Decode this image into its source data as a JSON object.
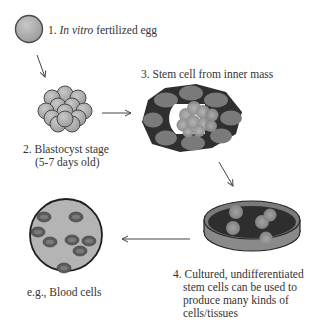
{
  "diagram": {
    "steps": [
      {
        "id": "egg",
        "number": "1.",
        "label_italic": "In vitro",
        "label_rest": " fertilized egg"
      },
      {
        "id": "blastocyst",
        "number": "2.",
        "line1": "Blastocyst stage",
        "line2": "(5-7 days old)"
      },
      {
        "id": "inner-mass",
        "number": "3.",
        "label": "Stem cell from inner mass"
      },
      {
        "id": "cultured",
        "number": "4.",
        "line1": "Cultured, undifferentiated",
        "line2": "stem cells can be used to",
        "line3": "produce many kinds of",
        "line4": "cells/tissues"
      },
      {
        "id": "blood",
        "label": "e.g., Blood cells"
      }
    ],
    "arrows": [
      {
        "from": "egg",
        "to": "blastocyst",
        "direction": "down-right"
      },
      {
        "from": "blastocyst",
        "to": "inner-mass",
        "direction": "right"
      },
      {
        "from": "inner-mass",
        "to": "cultured",
        "direction": "down-right"
      },
      {
        "from": "cultured",
        "to": "blood",
        "direction": "left"
      }
    ],
    "colors": {
      "cell_fill": "#a8a8a8",
      "cell_stroke": "#4a4a4a",
      "dark_ring": "#3a3a3a",
      "ring_cell": "#7a7a7a",
      "inner_mass": "#9a9a9a",
      "dish_dark": "#2e2e2e",
      "dish_rim": "#8a8a8a",
      "blood_bg": "#b4b4b4",
      "blood_cell": "#5a5a5a",
      "arrow": "#444444"
    }
  }
}
